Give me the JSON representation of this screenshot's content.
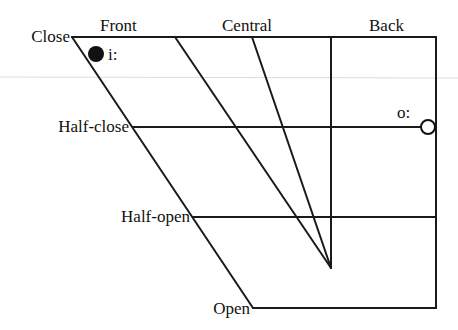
{
  "diagram": {
    "type": "vowel-quadrilateral",
    "column_labels": {
      "front": "Front",
      "central": "Central",
      "back": "Back"
    },
    "row_labels": {
      "close": "Close",
      "half_close": "Half-close",
      "half_open": "Half-open",
      "open": "Open"
    },
    "vowels": [
      {
        "symbol": "i:",
        "position": "close front",
        "marker": "filled-circle"
      },
      {
        "symbol": "o:",
        "position": "half-close back",
        "marker": "open-circle"
      }
    ]
  }
}
